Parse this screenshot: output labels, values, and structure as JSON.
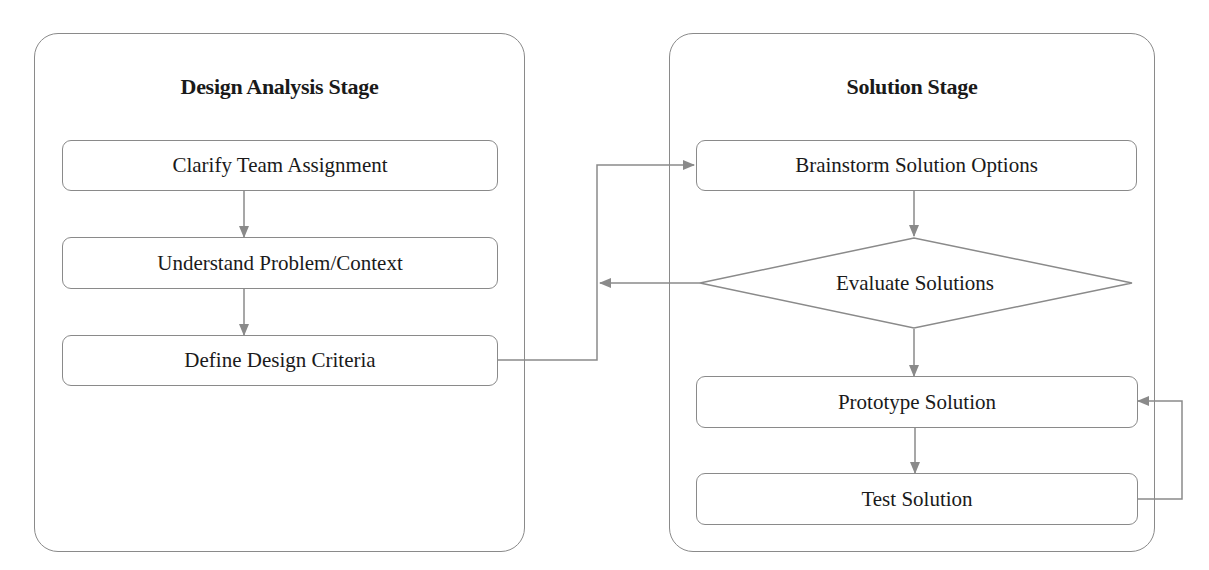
{
  "colors": {
    "stroke": "#8a8a8a",
    "text": "#1a1a1a",
    "background": "#ffffff"
  },
  "stages": [
    {
      "title": "Design Analysis Stage",
      "steps": [
        "Clarify Team Assignment",
        "Understand Problem/Context",
        "Define Design Criteria"
      ]
    },
    {
      "title": "Solution Stage",
      "steps": [
        "Brainstorm Solution Options",
        "Evaluate Solutions",
        "Prototype Solution",
        "Test Solution"
      ]
    }
  ],
  "connections": [
    {
      "from": "Clarify Team Assignment",
      "to": "Understand Problem/Context"
    },
    {
      "from": "Understand Problem/Context",
      "to": "Define Design Criteria"
    },
    {
      "from": "Define Design Criteria",
      "to": "Brainstorm Solution Options"
    },
    {
      "from": "Brainstorm Solution Options",
      "to": "Evaluate Solutions"
    },
    {
      "from": "Evaluate Solutions",
      "to": "Brainstorm Solution Options (loop back)"
    },
    {
      "from": "Evaluate Solutions",
      "to": "Prototype Solution"
    },
    {
      "from": "Prototype Solution",
      "to": "Test Solution"
    },
    {
      "from": "Test Solution",
      "to": "Prototype Solution (loop back)"
    }
  ]
}
